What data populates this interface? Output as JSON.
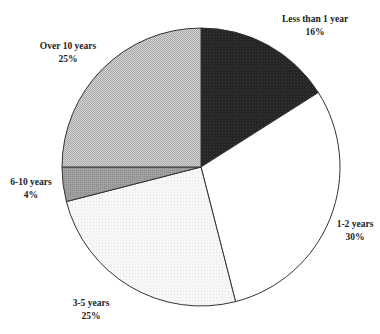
{
  "chart_data": {
    "type": "pie",
    "title": "",
    "start_angle_deg": 0,
    "direction": "clockwise",
    "categories": [
      "Less than 1 year",
      "1-2 years",
      "3-5 years",
      "6-10 years",
      "Over 10 years"
    ],
    "values": [
      16,
      30,
      25,
      4,
      25
    ],
    "value_labels": [
      "16%",
      "30%",
      "25%",
      "4%",
      "25%"
    ],
    "colors": [
      "#2a2a2a",
      "#ffffff",
      "#f4f4f4",
      "#9a9a9a",
      "#c8c8c8"
    ],
    "units": "%",
    "legend": "none (labels placed beside slices)"
  },
  "labels": [
    {
      "name": "Less than 1 year",
      "pct": "16%",
      "x": 315,
      "y": 13
    },
    {
      "name": "1-2 years",
      "pct": "30%",
      "x": 355,
      "y": 218
    },
    {
      "name": "3-5 years",
      "pct": "25%",
      "x": 91,
      "y": 297
    },
    {
      "name": "6-10 years",
      "pct": "4%",
      "x": 31,
      "y": 176
    },
    {
      "name": "Over 10 years",
      "pct": "25%",
      "x": 68,
      "y": 40
    }
  ]
}
